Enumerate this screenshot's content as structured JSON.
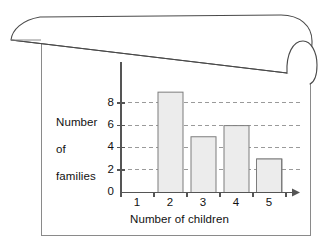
{
  "figure": {
    "kind": "bar-chart-on-curled-page",
    "frame_color": "#8a8a8a",
    "bar_fill": "#ececec",
    "bar_stroke": "#7d7d7d",
    "gridline_color": "#9a9a9a",
    "axis_color": "#555555",
    "text_color": "#111111"
  },
  "chart_data": {
    "type": "bar",
    "title": "",
    "subtitle": "",
    "xlabel": "Number of children",
    "ylabel": "Number\nof\nfamilies",
    "categories": [
      "1",
      "2",
      "3",
      "4",
      "5"
    ],
    "values": [
      1,
      9,
      5,
      6,
      3
    ],
    "series": [
      {
        "name": "Number of families",
        "values": [
          1,
          9,
          5,
          6,
          3
        ]
      }
    ],
    "ylim": [
      0,
      9
    ],
    "ytick_labels": [
      "0",
      "2",
      "4",
      "6",
      "8"
    ],
    "ytick_values": [
      0,
      2,
      4,
      6,
      8
    ],
    "xtick_labels": [
      "1",
      "2",
      "3",
      "4",
      "5"
    ],
    "grid": "horizontal-dashed",
    "legend": "none",
    "x_axis_arrow": true,
    "annotations": []
  },
  "axes": {
    "y_label_line1": "Number",
    "y_label_line2": "of",
    "y_label_line3": "families",
    "x_label": "Number of children"
  }
}
